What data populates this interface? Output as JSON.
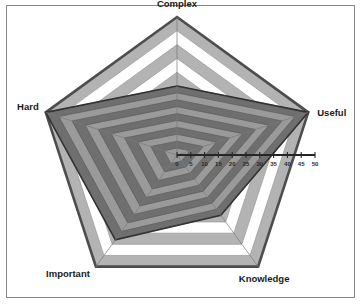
{
  "chart_data": {
    "type": "radar",
    "title": "",
    "categories": [
      "Complex",
      "Useful",
      "Knowledge",
      "Important",
      "Hard"
    ],
    "values": [
      25,
      50,
      27,
      38,
      50
    ],
    "series": [
      {
        "name": "Series 1",
        "values": [
          25,
          50,
          27,
          38,
          50
        ]
      }
    ],
    "tick_labels": [
      "0",
      "5",
      "10",
      "15",
      "20",
      "25",
      "30",
      "35",
      "40",
      "45",
      "50"
    ],
    "ticks": [
      0,
      5,
      10,
      15,
      20,
      25,
      30,
      35,
      40,
      45,
      50
    ],
    "rlim": [
      0,
      50
    ],
    "rstep": 5,
    "ring_count": 10,
    "grid": true,
    "legend": false,
    "axis_label_positions": [
      "top",
      "right",
      "bottom-right",
      "bottom-left",
      "top-left"
    ],
    "colors": {
      "band_light": "#ffffff",
      "band_dark": "#b3b3b3",
      "data_band_light": "#9a9a9a",
      "data_band_dark": "#6f6f6f",
      "outline": "#4d4d4d",
      "data_outline": "#333333",
      "frame_border": "#888888",
      "background": "#ffffff",
      "text": "#1a1a1a"
    }
  },
  "labels": {
    "complex": "Complex",
    "useful": "Useful",
    "knowledge": "Knowledge",
    "important": "Important",
    "hard": "Hard"
  }
}
